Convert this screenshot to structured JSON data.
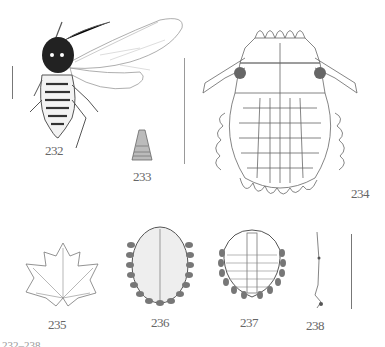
{
  "plate": {
    "figures": [
      {
        "id": "232",
        "label": "232",
        "subject": "winged aphid adult"
      },
      {
        "id": "233",
        "label": "233",
        "subject": "cornicle / siphunculus detail"
      },
      {
        "id": "234",
        "label": "234",
        "subject": "nymph dorsal view, detailed"
      },
      {
        "id": "235",
        "label": "235",
        "subject": "host plant leaf"
      },
      {
        "id": "236",
        "label": "236",
        "subject": "nymph dorsal view, stippled"
      },
      {
        "id": "237",
        "label": "237",
        "subject": "nymph dorsal view, segmented"
      },
      {
        "id": "238",
        "label": "238",
        "subject": "antenna / appendage detail"
      }
    ],
    "scale_bars": [
      "scale-bar-232",
      "scale-bar-234",
      "scale-bar-238"
    ],
    "caption_cropped": "232–238 ..."
  },
  "colors": {
    "ink": "#444444",
    "dark_fill": "#222222",
    "stipple": "#888888"
  }
}
